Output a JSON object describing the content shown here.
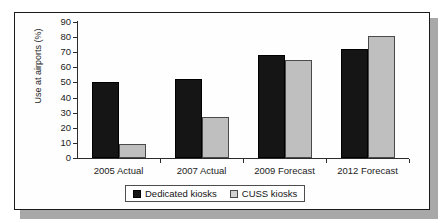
{
  "chart_data": {
    "type": "bar",
    "title": "",
    "xlabel": "",
    "ylabel": "Use at airports (%)",
    "ylim": [
      0,
      90
    ],
    "ytick_step": 10,
    "yticks": [
      90,
      80,
      70,
      60,
      50,
      40,
      30,
      20,
      10,
      0
    ],
    "grid": false,
    "legend_position": "bottom",
    "categories": [
      "2005 Actual",
      "2007 Actual",
      "2009 Forecast",
      "2012 Forecast"
    ],
    "series": [
      {
        "name": "Dedicated kiosks",
        "color": "#151515",
        "values": [
          50,
          52,
          68,
          72
        ]
      },
      {
        "name": "CUSS kiosks",
        "color": "#bfbfbf",
        "values": [
          9,
          27,
          65,
          81
        ]
      }
    ]
  },
  "legend": {
    "items": [
      {
        "label": "Dedicated kiosks",
        "swatch": "dedicated"
      },
      {
        "label": "CUSS kiosks",
        "swatch": "cuss"
      }
    ]
  },
  "colors": {
    "dedicated": "#151515",
    "cuss": "#bfbfbf",
    "axis": "#2b2b2b",
    "frame": "#1a1a1a",
    "shadow": "#a8a8a8"
  }
}
